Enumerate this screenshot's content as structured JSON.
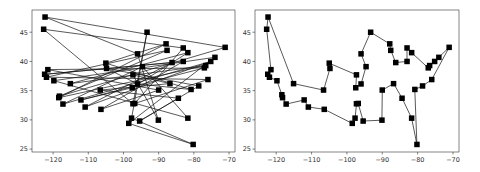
{
  "chart_data": [
    {
      "type": "line",
      "title": "",
      "xlabel": "",
      "ylabel": "",
      "description": "Random tour through cities (longitude vs latitude)",
      "xlim": [
        -126,
        -68.3
      ],
      "ylim": [
        24.5,
        48.8
      ],
      "xticks": [
        -120,
        -110,
        -100,
        -90,
        -80,
        -70
      ],
      "yticks": [
        25,
        30,
        35,
        40,
        45
      ],
      "xtick_labels": [
        "−120",
        "−110",
        "−100",
        "−90",
        "−80",
        "−70"
      ],
      "ytick_labels": [
        "25",
        "30",
        "35",
        "40",
        "45"
      ],
      "grid": false,
      "marker": "square",
      "color": "#000000",
      "series": [
        {
          "name": "random-tour",
          "points": [
            [
              -122.3,
              47.6
            ],
            [
              -71.1,
              42.4
            ],
            [
              -118.2,
              34.05
            ],
            [
              -87.6,
              41.9
            ],
            [
              -121.9,
              37.3
            ],
            [
              -76.0,
              36.9
            ],
            [
              -96.8,
              32.8
            ],
            [
              -83.0,
              42.3
            ],
            [
              -122.7,
              45.5
            ],
            [
              -97.3,
              32.75
            ],
            [
              -93.3,
              45.0
            ],
            [
              -97.7,
              30.3
            ],
            [
              -80.2,
              25.8
            ],
            [
              -98.5,
              29.4
            ],
            [
              -74.0,
              40.7
            ],
            [
              -119.8,
              36.7
            ],
            [
              -81.7,
              30.3
            ],
            [
              -94.6,
              39.1
            ],
            [
              -117.2,
              32.7
            ],
            [
              -75.2,
              40.0
            ],
            [
              -110.9,
              32.2
            ],
            [
              -86.2,
              39.8
            ],
            [
              -122.4,
              37.8
            ],
            [
              -83.0,
              40.0
            ],
            [
              -106.4,
              31.8
            ],
            [
              -90.0,
              35.1
            ],
            [
              -121.5,
              38.6
            ],
            [
              -77.0,
              38.9
            ],
            [
              -112.1,
              33.4
            ],
            [
              -97.5,
              35.5
            ],
            [
              -81.7,
              41.5
            ],
            [
              -115.1,
              36.2
            ],
            [
              -76.6,
              39.3
            ],
            [
              -118.4,
              33.8
            ],
            [
              -87.9,
              43.0
            ],
            [
              -105.0,
              39.7
            ],
            [
              -80.8,
              35.2
            ],
            [
              -96.0,
              36.15
            ],
            [
              -104.8,
              38.8
            ],
            [
              -78.6,
              35.8
            ],
            [
              -95.4,
              29.8
            ],
            [
              -84.4,
              33.7
            ],
            [
              -106.6,
              35.1
            ],
            [
              -86.8,
              36.2
            ],
            [
              -97.3,
              37.7
            ],
            [
              -90.1,
              29.95
            ],
            [
              -96.0,
              41.3
            ],
            [
              -122.3,
              47.6
            ]
          ]
        }
      ]
    },
    {
      "type": "line",
      "title": "",
      "xlabel": "",
      "ylabel": "",
      "description": "Optimized tour through the same cities (longitude vs latitude)",
      "xlim": [
        -126,
        -68.3
      ],
      "ylim": [
        24.5,
        48.8
      ],
      "xticks": [
        -120,
        -110,
        -100,
        -90,
        -80,
        -70
      ],
      "yticks": [
        25,
        30,
        35,
        40,
        45
      ],
      "xtick_labels": [
        "−120",
        "−110",
        "−100",
        "−90",
        "−80",
        "−70"
      ],
      "ytick_labels": [
        "25",
        "30",
        "35",
        "40",
        "45"
      ],
      "grid": false,
      "marker": "square",
      "color": "#000000",
      "series": [
        {
          "name": "optimized-tour",
          "points": [
            [
              -122.3,
              47.6
            ],
            [
              -122.7,
              45.5
            ],
            [
              -121.5,
              38.6
            ],
            [
              -122.4,
              37.8
            ],
            [
              -121.9,
              37.3
            ],
            [
              -119.8,
              36.7
            ],
            [
              -118.4,
              34.3
            ],
            [
              -118.2,
              33.8
            ],
            [
              -117.2,
              32.7
            ],
            [
              -112.1,
              33.4
            ],
            [
              -110.9,
              32.2
            ],
            [
              -106.4,
              31.8
            ],
            [
              -98.5,
              29.4
            ],
            [
              -97.7,
              30.3
            ],
            [
              -97.3,
              32.75
            ],
            [
              -96.8,
              32.8
            ],
            [
              -95.4,
              29.8
            ],
            [
              -90.1,
              29.95
            ],
            [
              -90.0,
              35.1
            ],
            [
              -86.8,
              36.2
            ],
            [
              -84.4,
              33.7
            ],
            [
              -81.7,
              30.3
            ],
            [
              -80.2,
              25.8
            ],
            [
              -80.8,
              35.2
            ],
            [
              -78.6,
              35.8
            ],
            [
              -76.0,
              36.9
            ],
            [
              -71.1,
              42.4
            ],
            [
              -74.0,
              40.7
            ],
            [
              -75.2,
              40.0
            ],
            [
              -76.6,
              39.3
            ],
            [
              -77.0,
              38.9
            ],
            [
              -81.7,
              41.5
            ],
            [
              -83.0,
              42.3
            ],
            [
              -83.0,
              40.0
            ],
            [
              -86.2,
              39.8
            ],
            [
              -87.6,
              41.9
            ],
            [
              -87.9,
              43.0
            ],
            [
              -93.3,
              45.0
            ],
            [
              -96.0,
              41.3
            ],
            [
              -94.6,
              39.1
            ],
            [
              -96.0,
              36.15
            ],
            [
              -97.5,
              35.5
            ],
            [
              -97.3,
              37.7
            ],
            [
              -105.0,
              39.7
            ],
            [
              -104.8,
              38.8
            ],
            [
              -106.6,
              35.1
            ],
            [
              -115.1,
              36.2
            ],
            [
              -122.3,
              47.6
            ]
          ]
        }
      ]
    }
  ]
}
